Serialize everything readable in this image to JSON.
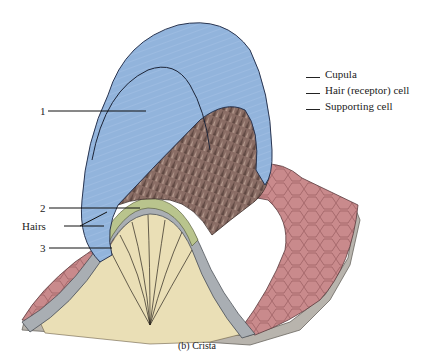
{
  "figure": {
    "caption": "(b) Crista",
    "legend": [
      {
        "label": "Cupula"
      },
      {
        "label": "Hair (receptor) cell"
      },
      {
        "label": "Supporting cell"
      }
    ],
    "callouts": [
      {
        "label": "1",
        "target": "cupula"
      },
      {
        "label": "2",
        "target": "hair cell layer"
      },
      {
        "label": "Hairs",
        "target": "hair bundles"
      },
      {
        "label": "3",
        "target": "supporting cell"
      }
    ],
    "colors": {
      "cupula": "#92b4dc",
      "cupula_outline": "#2a3550",
      "hair_surface": "#7a5f58",
      "epithelium_top": "#c98a8c",
      "cell_layer": "#a9aeb3",
      "hair_cell_layer": "#b9c48d",
      "connective_tissue": "#eadfb6",
      "base_layer": "#b8b4ad"
    }
  }
}
